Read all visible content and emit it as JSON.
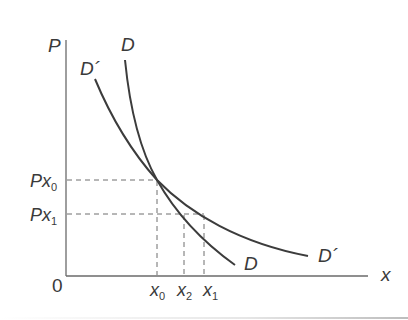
{
  "diagram": {
    "type": "economics-demand-curves",
    "axes": {
      "y_label": "P",
      "x_label": "x",
      "origin_label": "0"
    },
    "curves": [
      {
        "name": "D",
        "label_top": "D",
        "label_bottom": "D",
        "description": "steeper demand curve"
      },
      {
        "name": "D'",
        "label_top": "D´",
        "label_bottom": "D´",
        "description": "flatter demand curve"
      }
    ],
    "price_levels": [
      {
        "base": "Px",
        "sub": "0"
      },
      {
        "base": "Px",
        "sub": "1"
      }
    ],
    "quantity_levels": [
      {
        "base": "x",
        "sub": "0"
      },
      {
        "base": "x",
        "sub": "2"
      },
      {
        "base": "x",
        "sub": "1"
      }
    ],
    "colors": {
      "curve": "#3c3c3c",
      "axis": "#6a6a6a",
      "dashed": "#6e6e6e",
      "text": "#3a3a3a"
    }
  }
}
